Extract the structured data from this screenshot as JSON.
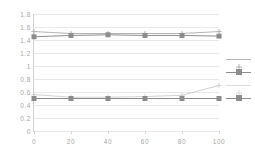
{
  "chart_data": {
    "type": "line",
    "title": "",
    "subtitle": "",
    "xlabel": "",
    "ylabel": "",
    "x": [
      0,
      20,
      40,
      60,
      80,
      100
    ],
    "categories": [
      "0",
      "20",
      "40",
      "60",
      "80",
      "100"
    ],
    "xlim": [
      0,
      100
    ],
    "ylim": [
      0,
      1.8
    ],
    "grid": true,
    "legend_position": "right",
    "y_ticks": [
      "1.8",
      "1.6",
      "1.4",
      "1.2",
      "1",
      "0.8",
      "0.6",
      "0.4",
      "0.2",
      "0"
    ],
    "y_tick_values": [
      1.8,
      1.6,
      1.4,
      1.2,
      1.0,
      0.8,
      0.6,
      0.4,
      0.2,
      0.0
    ],
    "x_ticks": [
      "0",
      "20",
      "40",
      "60",
      "80",
      "100"
    ],
    "series": [
      {
        "name": "",
        "color": "#b4b4b4",
        "marker": "cross",
        "values": [
          1.53,
          1.5,
          1.5,
          1.5,
          1.5,
          1.53
        ]
      },
      {
        "name": "",
        "color": "#8c8c8c",
        "marker": "square",
        "values": [
          1.45,
          1.47,
          1.48,
          1.47,
          1.47,
          1.46
        ]
      },
      {
        "name": "",
        "color": "#d2d2d2",
        "marker": "cross",
        "values": [
          0.56,
          0.52,
          0.52,
          0.53,
          0.55,
          0.7
        ]
      },
      {
        "name": "",
        "color": "#8c8c8c",
        "marker": "square",
        "values": [
          0.5,
          0.5,
          0.5,
          0.5,
          0.5,
          0.5
        ]
      }
    ],
    "legend_entries": [
      {
        "label": "",
        "color": "#b4b4b4",
        "marker": "cross"
      },
      {
        "label": "",
        "color": "#8c8c8c",
        "marker": "square"
      },
      {
        "label": "",
        "color": "#dcdcdc",
        "marker": "cross"
      },
      {
        "label": "",
        "color": "#8c8c8c",
        "marker": "square"
      }
    ]
  },
  "colors": {
    "background": "#ffffff",
    "gridline": "#e8e8e8",
    "axis": "#d2d2d2",
    "tick_text": "#a8a8a8"
  }
}
